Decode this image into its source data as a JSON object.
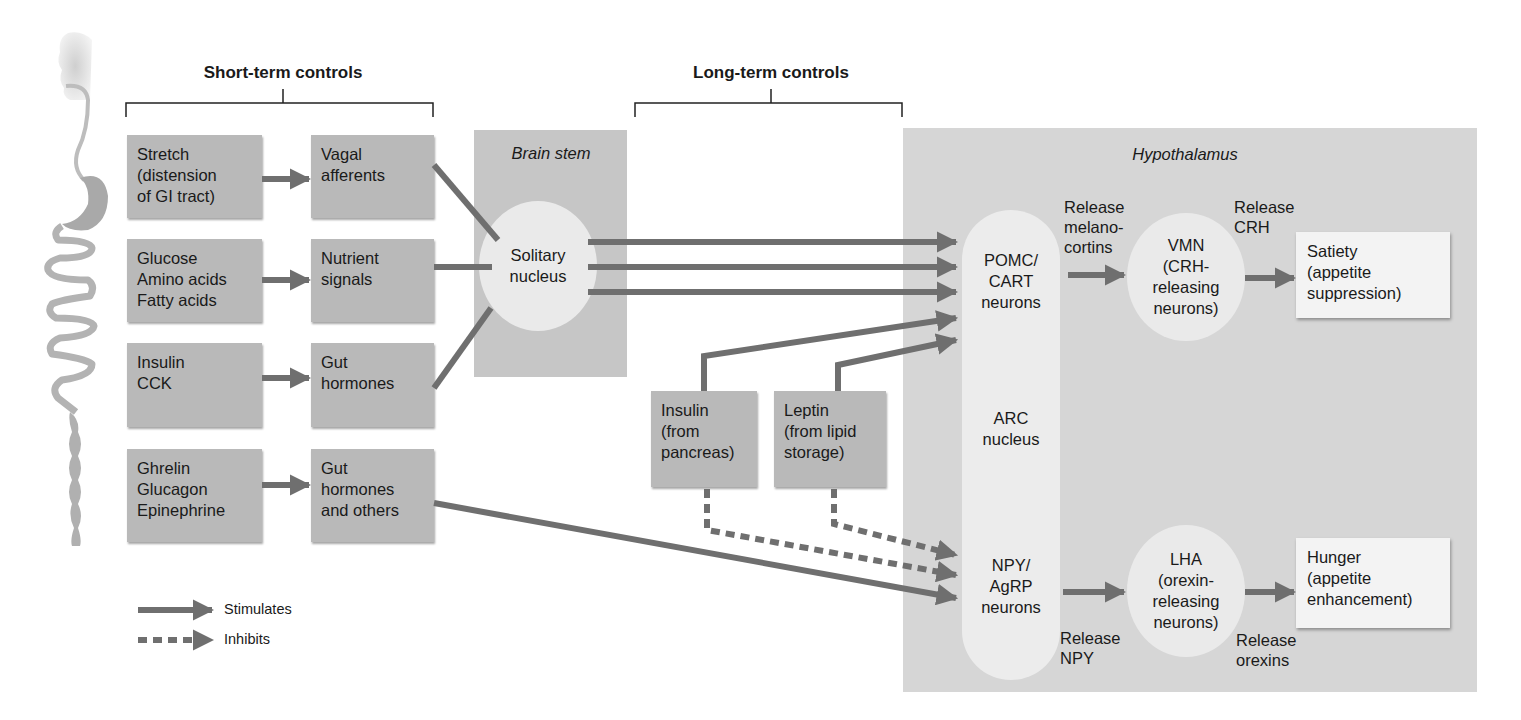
{
  "headings": {
    "short_term": "Short-term controls",
    "long_term": "Long-term controls"
  },
  "short_term_inputs": [
    {
      "stimulus": "Stretch\n(distension\nof GI tract)",
      "signal": "Vagal\nafferents"
    },
    {
      "stimulus": "Glucose\nAmino acids\nFatty acids",
      "signal": "Nutrient\nsignals"
    },
    {
      "stimulus": "Insulin\nCCK",
      "signal": "Gut\nhormones"
    },
    {
      "stimulus": "Ghrelin\nGlucagon\nEpinephrine",
      "signal": "Gut\nhormones\nand others"
    }
  ],
  "brain_stem": {
    "title": "Brain stem",
    "nucleus": "Solitary\nnucleus"
  },
  "long_term_inputs": [
    {
      "label": "Insulin\n(from\npancreas)"
    },
    {
      "label": "Leptin\n(from lipid\nstorage)"
    }
  ],
  "hypothalamus": {
    "title": "Hypothalamus",
    "arc_top": "POMC/\nCART\nneurons",
    "arc_middle": "ARC\nnucleus",
    "arc_bottom": "NPY/\nAgRP\nneurons",
    "vmn": "VMN\n(CRH-\nreleasing\nneurons)",
    "lha": "LHA\n(orexin-\nreleasing\nneurons)",
    "release_melanocortins": "Release\nmelano-\ncortins",
    "release_crh": "Release\nCRH",
    "release_npy": "Release\nNPY",
    "release_orexins": "Release\norexins",
    "satiety": "Satiety\n(appetite\nsuppression)",
    "hunger": "Hunger\n(appetite\nenhancement)"
  },
  "legend": {
    "stimulates": "Stimulates",
    "inhibits": "Inhibits"
  },
  "colors": {
    "arrow": "#6f6f6f",
    "box": "#b9b9b9",
    "brain_stem_panel": "#c6c6c6",
    "hypothalamus_panel": "#d6d6d6",
    "nucleus_fill": "#eaeaea",
    "output_box": "#f3f3f3"
  }
}
